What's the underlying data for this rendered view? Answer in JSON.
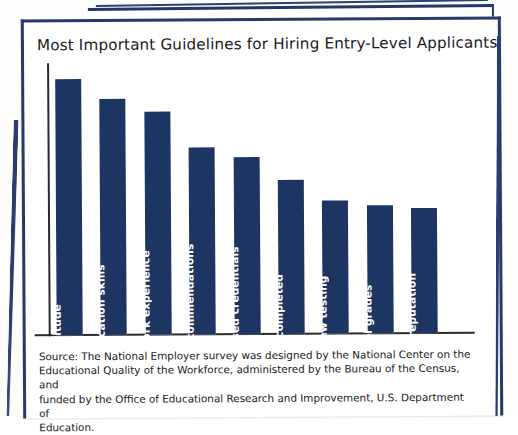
{
  "document": {
    "type": "scanned-book-page",
    "background_color": "#ffffff",
    "border_color": "#27396b"
  },
  "chart_data": {
    "type": "bar",
    "title": "Most Important Guidelines for Hiring Entry-Level Applicants",
    "xlabel": "",
    "ylabel": "",
    "grid": false,
    "legend": false,
    "orientation": "vertical",
    "bar_color": "#1c3563",
    "label_color": "#ffffff",
    "label_rotation": -90,
    "ylim": [
      0,
      100
    ],
    "categories": [
      "Attitude",
      "Communication skills",
      "Previous work experience",
      "Employer recommendations",
      "Industry-based credentials",
      "School completed",
      "Interview testing",
      "School grades",
      "School reputation"
    ],
    "values": [
      100,
      92,
      87,
      73,
      69,
      60,
      52,
      50,
      49
    ]
  },
  "source": {
    "lines": [
      "Source: The National Employer survey was designed by the National Center on the",
      "Educational Quality of the Workforce, administered by the Bureau of the Census, and",
      "funded by the Office of Educational Research and Improvement, U.S. Department of",
      "Education."
    ]
  }
}
